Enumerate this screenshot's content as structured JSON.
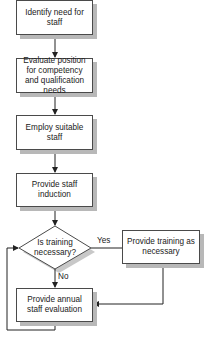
{
  "diagram": {
    "type": "flowchart",
    "nodes": [
      {
        "id": "identify",
        "shape": "rect",
        "label": "Identify need for staff",
        "x": 16,
        "y": 0,
        "w": 77,
        "h": 35
      },
      {
        "id": "evaluate_position",
        "shape": "rect",
        "label": "Evaluate position for competency and qualification needs",
        "x": 16,
        "y": 58,
        "w": 77,
        "h": 35
      },
      {
        "id": "employ",
        "shape": "rect",
        "label": "Employ suitable staff",
        "x": 16,
        "y": 115,
        "w": 77,
        "h": 35
      },
      {
        "id": "induction",
        "shape": "rect",
        "label": "Provide staff induction",
        "x": 16,
        "y": 173,
        "w": 77,
        "h": 34
      },
      {
        "id": "decision",
        "shape": "diamond",
        "label": "Is training necessary?",
        "cx": 55,
        "cy": 248,
        "w": 72,
        "h": 43
      },
      {
        "id": "training",
        "shape": "rect",
        "label": "Provide training as necessary",
        "x": 122,
        "y": 230,
        "w": 78,
        "h": 34
      },
      {
        "id": "annual_eval",
        "shape": "rect",
        "label": "Provide annual staff evaluation",
        "x": 16,
        "y": 288,
        "w": 77,
        "h": 34
      }
    ],
    "edges": [
      {
        "from": "identify",
        "to": "evaluate_position",
        "label": ""
      },
      {
        "from": "evaluate_position",
        "to": "employ",
        "label": ""
      },
      {
        "from": "employ",
        "to": "induction",
        "label": ""
      },
      {
        "from": "induction",
        "to": "decision",
        "label": ""
      },
      {
        "from": "decision",
        "to": "training",
        "label": "Yes"
      },
      {
        "from": "decision",
        "to": "annual_eval",
        "label": "No"
      },
      {
        "from": "training",
        "to": "annual_eval",
        "label": ""
      },
      {
        "from": "annual_eval",
        "to": "decision",
        "label": ""
      }
    ],
    "edge_labels": {
      "yes": "Yes",
      "no": "No"
    },
    "colors": {
      "line": "#222222",
      "border": "#4a4a4a",
      "shadow": "#b8b8b8",
      "fill": "#ffffff"
    }
  },
  "labels": {
    "identify": "Identify need for staff",
    "evaluate_position": "Evaluate position for competency and qualification needs",
    "employ": "Employ suitable staff",
    "induction": "Provide staff induction",
    "decision": "Is training necessary?",
    "training": "Provide training as necessary",
    "annual_eval": "Provide annual staff evaluation",
    "yes": "Yes",
    "no": "No"
  }
}
